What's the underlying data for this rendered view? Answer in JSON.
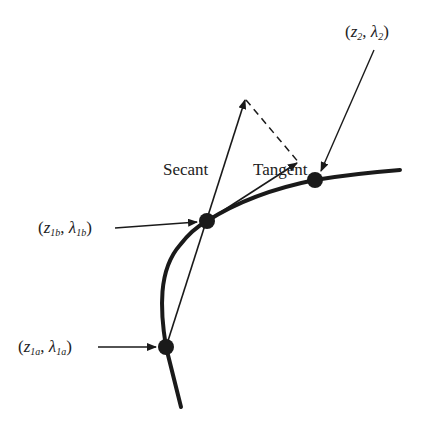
{
  "diagram": {
    "labels": {
      "secant": "Secant",
      "tangent": "Tangent"
    },
    "points": [
      {
        "id": "p2",
        "var1": "z",
        "sub1": "2",
        "var2": "λ",
        "sub2": "2",
        "x": 315,
        "y": 180
      },
      {
        "id": "p1b",
        "var1": "z",
        "sub1": "1b",
        "var2": "λ",
        "sub2": "1b",
        "x": 207,
        "y": 221
      },
      {
        "id": "p1a",
        "var1": "z",
        "sub1": "1a",
        "var2": "λ",
        "sub2": "1a",
        "x": 166,
        "y": 347
      }
    ],
    "colors": {
      "line": "#1a1a1a",
      "background": "#ffffff"
    }
  }
}
